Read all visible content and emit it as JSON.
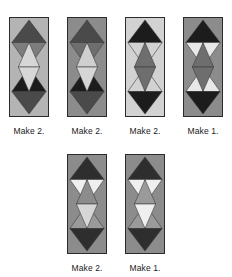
{
  "page": {
    "background_color": "#ffffff",
    "caption_color": "#1a1a1a",
    "tile_border_color": "#2b2b2b",
    "triangle_outline_color": "#3a3a3a"
  },
  "palette": {
    "black": "#1c1c1c",
    "dark_gray": "#4a4a4a",
    "mid_gray": "#7d7d7d",
    "light_gray": "#b4b4b4",
    "pale_gray": "#d6d6d6",
    "white": "#f1f1f1"
  },
  "legend": {
    "shape": "diamond-triangle-quilt-block",
    "grid": "2 columns x 4 rows of triangles per tile"
  },
  "rows": [
    {
      "name": "top-row",
      "blocks": [
        {
          "id": "block-1",
          "caption": "Make 2.",
          "background": "#b4b4b4",
          "triangles": [
            {
              "row": 1,
              "col": "left",
              "dir": "up",
              "color": "#4a4a4a"
            },
            {
              "row": 1,
              "col": "right",
              "dir": "up",
              "color": "#4a4a4a"
            },
            {
              "row": 2,
              "col": "left",
              "dir": "down",
              "color": "#7d7d7d"
            },
            {
              "row": 2,
              "col": "right",
              "dir": "down",
              "color": "#7d7d7d"
            },
            {
              "row": 2,
              "col": "mid",
              "dir": "up",
              "color": "#d6d6d6"
            },
            {
              "row": 3,
              "col": "left",
              "dir": "down",
              "color": "#1c1c1c"
            },
            {
              "row": 3,
              "col": "right",
              "dir": "down",
              "color": "#1c1c1c"
            },
            {
              "row": 3,
              "col": "mid",
              "dir": "up",
              "color": "#d6d6d6"
            },
            {
              "row": 4,
              "col": "left",
              "dir": "down",
              "color": "#4a4a4a"
            },
            {
              "row": 4,
              "col": "right",
              "dir": "down",
              "color": "#4a4a4a"
            }
          ]
        },
        {
          "id": "block-2",
          "caption": "Make 2.",
          "background": "#8c8c8c",
          "triangles": [
            {
              "row": 1,
              "col": "left",
              "dir": "up",
              "color": "#4a4a4a"
            },
            {
              "row": 1,
              "col": "right",
              "dir": "up",
              "color": "#4a4a4a"
            },
            {
              "row": 2,
              "col": "left",
              "dir": "down",
              "color": "#6e6e6e"
            },
            {
              "row": 2,
              "col": "right",
              "dir": "down",
              "color": "#6e6e6e"
            },
            {
              "row": 2,
              "col": "mid",
              "dir": "up",
              "color": "#cfcfcf"
            },
            {
              "row": 3,
              "col": "left",
              "dir": "down",
              "color": "#1c1c1c"
            },
            {
              "row": 3,
              "col": "right",
              "dir": "down",
              "color": "#1c1c1c"
            },
            {
              "row": 3,
              "col": "mid",
              "dir": "up",
              "color": "#d6d6d6"
            },
            {
              "row": 4,
              "col": "left",
              "dir": "down",
              "color": "#4a4a4a"
            },
            {
              "row": 4,
              "col": "right",
              "dir": "down",
              "color": "#4a4a4a"
            }
          ]
        },
        {
          "id": "block-3",
          "caption": "Make 2.",
          "background": "#d2d2d2",
          "triangles": [
            {
              "row": 1,
              "col": "left",
              "dir": "up",
              "color": "#1c1c1c"
            },
            {
              "row": 1,
              "col": "right",
              "dir": "up",
              "color": "#1c1c1c"
            },
            {
              "row": 2,
              "col": "left",
              "dir": "down",
              "color": "#d2d2d2"
            },
            {
              "row": 2,
              "col": "right",
              "dir": "down",
              "color": "#d2d2d2"
            },
            {
              "row": 2,
              "col": "mid",
              "dir": "up",
              "color": "#6e6e6e"
            },
            {
              "row": 3,
              "col": "left",
              "dir": "down",
              "color": "#d2d2d2"
            },
            {
              "row": 3,
              "col": "right",
              "dir": "down",
              "color": "#d2d2d2"
            },
            {
              "row": 3,
              "col": "mid",
              "dir": "up",
              "color": "#6e6e6e"
            },
            {
              "row": 4,
              "col": "left",
              "dir": "down",
              "color": "#1c1c1c"
            },
            {
              "row": 4,
              "col": "right",
              "dir": "down",
              "color": "#1c1c1c"
            }
          ]
        },
        {
          "id": "block-4",
          "caption": "Make 1.",
          "background": "#8c8c8c",
          "triangles": [
            {
              "row": 1,
              "col": "left",
              "dir": "up",
              "color": "#1c1c1c"
            },
            {
              "row": 1,
              "col": "right",
              "dir": "up",
              "color": "#1c1c1c"
            },
            {
              "row": 2,
              "col": "left",
              "dir": "down",
              "color": "#e8e8e8"
            },
            {
              "row": 2,
              "col": "right",
              "dir": "down",
              "color": "#e8e8e8"
            },
            {
              "row": 2,
              "col": "mid",
              "dir": "up",
              "color": "#6e6e6e"
            },
            {
              "row": 3,
              "col": "left",
              "dir": "down",
              "color": "#e8e8e8"
            },
            {
              "row": 3,
              "col": "right",
              "dir": "down",
              "color": "#e8e8e8"
            },
            {
              "row": 3,
              "col": "mid",
              "dir": "up",
              "color": "#6e6e6e"
            },
            {
              "row": 4,
              "col": "left",
              "dir": "down",
              "color": "#1c1c1c"
            },
            {
              "row": 4,
              "col": "right",
              "dir": "down",
              "color": "#1c1c1c"
            }
          ]
        }
      ]
    },
    {
      "name": "bottom-row",
      "blocks": [
        {
          "id": "block-5",
          "caption": "Make 2.",
          "background": "#8c8c8c",
          "triangles": [
            {
              "row": 1,
              "col": "left",
              "dir": "up",
              "color": "#2e2e2e"
            },
            {
              "row": 1,
              "col": "right",
              "dir": "up",
              "color": "#2e2e2e"
            },
            {
              "row": 2,
              "col": "left",
              "dir": "down",
              "color": "#efefef"
            },
            {
              "row": 2,
              "col": "right",
              "dir": "down",
              "color": "#efefef"
            },
            {
              "row": 2,
              "col": "mid",
              "dir": "up",
              "color": "#8c8c8c"
            },
            {
              "row": 3,
              "col": "left",
              "dir": "down",
              "color": "#9a9a9a"
            },
            {
              "row": 3,
              "col": "right",
              "dir": "down",
              "color": "#9a9a9a"
            },
            {
              "row": 3,
              "col": "mid",
              "dir": "up",
              "color": "#d6d6d6"
            },
            {
              "row": 4,
              "col": "left",
              "dir": "down",
              "color": "#2e2e2e"
            },
            {
              "row": 4,
              "col": "right",
              "dir": "down",
              "color": "#2e2e2e"
            }
          ]
        },
        {
          "id": "block-6",
          "caption": "Make 1.",
          "background": "#8c8c8c",
          "triangles": [
            {
              "row": 1,
              "col": "left",
              "dir": "up",
              "color": "#2e2e2e"
            },
            {
              "row": 1,
              "col": "right",
              "dir": "up",
              "color": "#2e2e2e"
            },
            {
              "row": 2,
              "col": "left",
              "dir": "down",
              "color": "#efefef"
            },
            {
              "row": 2,
              "col": "right",
              "dir": "down",
              "color": "#efefef"
            },
            {
              "row": 2,
              "col": "mid",
              "dir": "up",
              "color": "#9a9a9a"
            },
            {
              "row": 3,
              "col": "left",
              "dir": "down",
              "color": "#9a9a9a"
            },
            {
              "row": 3,
              "col": "right",
              "dir": "down",
              "color": "#9a9a9a"
            },
            {
              "row": 3,
              "col": "mid",
              "dir": "up",
              "color": "#efefef"
            },
            {
              "row": 4,
              "col": "left",
              "dir": "down",
              "color": "#2e2e2e"
            },
            {
              "row": 4,
              "col": "right",
              "dir": "down",
              "color": "#2e2e2e"
            }
          ]
        }
      ]
    }
  ]
}
